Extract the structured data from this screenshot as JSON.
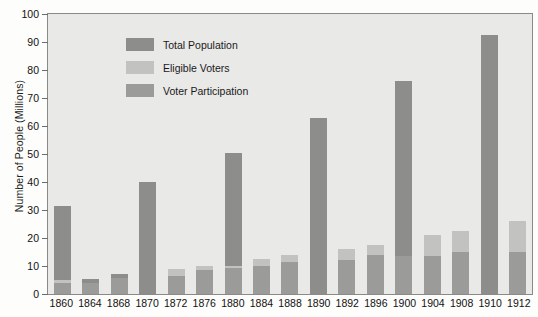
{
  "chart_data": {
    "type": "bar",
    "title": "",
    "subtitle": "",
    "xlabel": "",
    "ylabel": "Number of People (Millions)",
    "ylim": [
      0,
      100
    ],
    "yticks": [
      0,
      10,
      20,
      30,
      40,
      50,
      60,
      70,
      80,
      90,
      100
    ],
    "grid": false,
    "stacked": true,
    "legend_position": "top-left",
    "categories": [
      "1860",
      "1864",
      "1868",
      "1870",
      "1872",
      "1876",
      "1880",
      "1884",
      "1888",
      "1890",
      "1892",
      "1896",
      "1900",
      "1904",
      "1908",
      "1910",
      "1912"
    ],
    "legend": [
      "Total Population",
      "Eligible Voters",
      "Voter Participation"
    ],
    "series": [
      {
        "name": "Total Population",
        "color": "#8d8d8c",
        "values": [
          31.5,
          5.2,
          7.0,
          40.0,
          9.0,
          10.0,
          50.5,
          12.5,
          14.0,
          63.0,
          16.0,
          17.5,
          76.0,
          21.0,
          22.5,
          92.5,
          26.0
        ]
      },
      {
        "name": "Eligible Voters",
        "color": "#c2c2c0",
        "values": [
          5.0,
          0,
          0,
          0,
          9.0,
          10.0,
          10.0,
          12.5,
          14.0,
          0,
          16.0,
          17.5,
          13.5,
          21.0,
          22.5,
          0,
          26.0
        ]
      },
      {
        "name": "Voter Participation",
        "color": "#9b9b99",
        "values": [
          4.0,
          4.0,
          5.7,
          0,
          6.5,
          8.5,
          9.2,
          10.0,
          11.4,
          0,
          12.0,
          13.9,
          13.5,
          13.5,
          14.9,
          0,
          15.0
        ]
      }
    ],
    "colors": {
      "total_population": "#8d8d8c",
      "eligible_voters": "#c2c2c0",
      "voter_participation": "#9b9b99",
      "plot_background": "#e9e9e7",
      "page_background": "#fdfdfb",
      "axis": "#8a8a88"
    }
  }
}
